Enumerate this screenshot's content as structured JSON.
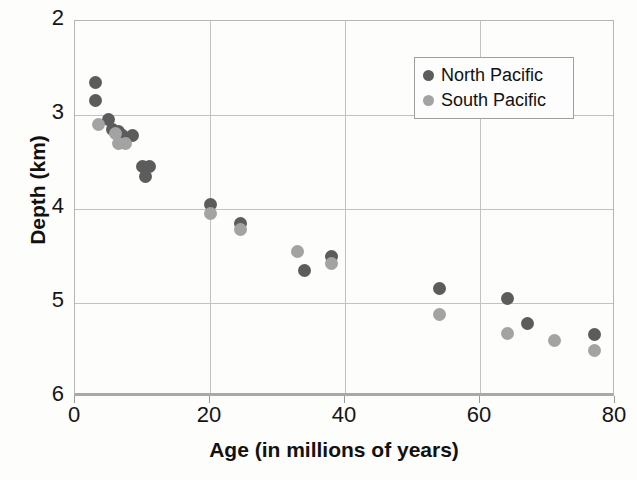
{
  "chart_data": {
    "type": "scatter",
    "title": "",
    "xlabel": "Age (in millions of years)",
    "ylabel": "Depth (km)",
    "xlim": [
      0,
      80
    ],
    "ylim": [
      6,
      2
    ],
    "y_axis_inverted": true,
    "xticks": [
      0,
      20,
      40,
      60,
      80
    ],
    "yticks": [
      2,
      3,
      4,
      5,
      6
    ],
    "xtick_labels": [
      "0",
      "20",
      "40",
      "60",
      "80"
    ],
    "ytick_labels": [
      "2",
      "3",
      "4",
      "5",
      "6"
    ],
    "grid": true,
    "legend_position": "top-right",
    "colors": {
      "north_pacific": "#5c5c5c",
      "south_pacific": "#a3a3a3",
      "gridline": "#c2c2c2",
      "axis": "#a9a9a9",
      "background": "#fdfdfc",
      "text": "#111111"
    },
    "series": [
      {
        "name": "North Pacific",
        "color": "#5c5c5c",
        "points": [
          {
            "age": 3.0,
            "depth": 2.65
          },
          {
            "age": 3.0,
            "depth": 2.85
          },
          {
            "age": 5.0,
            "depth": 3.05
          },
          {
            "age": 5.5,
            "depth": 3.15
          },
          {
            "age": 6.5,
            "depth": 3.18
          },
          {
            "age": 7.0,
            "depth": 3.22
          },
          {
            "age": 8.5,
            "depth": 3.22
          },
          {
            "age": 10.0,
            "depth": 3.55
          },
          {
            "age": 11.0,
            "depth": 3.55
          },
          {
            "age": 10.5,
            "depth": 3.65
          },
          {
            "age": 20.0,
            "depth": 3.95
          },
          {
            "age": 24.5,
            "depth": 4.15
          },
          {
            "age": 34.0,
            "depth": 4.65
          },
          {
            "age": 38.0,
            "depth": 4.5
          },
          {
            "age": 54.0,
            "depth": 4.85
          },
          {
            "age": 64.0,
            "depth": 4.95
          },
          {
            "age": 67.0,
            "depth": 5.22
          },
          {
            "age": 77.0,
            "depth": 5.33
          }
        ]
      },
      {
        "name": "South Pacific",
        "color": "#a3a3a3",
        "points": [
          {
            "age": 3.5,
            "depth": 3.1
          },
          {
            "age": 6.0,
            "depth": 3.2
          },
          {
            "age": 6.5,
            "depth": 3.3
          },
          {
            "age": 7.5,
            "depth": 3.3
          },
          {
            "age": 20.0,
            "depth": 4.05
          },
          {
            "age": 24.5,
            "depth": 4.22
          },
          {
            "age": 33.0,
            "depth": 4.45
          },
          {
            "age": 38.0,
            "depth": 4.58
          },
          {
            "age": 54.0,
            "depth": 5.12
          },
          {
            "age": 64.0,
            "depth": 5.32
          },
          {
            "age": 71.0,
            "depth": 5.4
          },
          {
            "age": 77.0,
            "depth": 5.5
          }
        ]
      }
    ],
    "legend": [
      {
        "label": "North Pacific",
        "color": "#5c5c5c"
      },
      {
        "label": "South Pacific",
        "color": "#a3a3a3"
      }
    ]
  }
}
